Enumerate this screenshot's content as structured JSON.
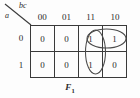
{
  "figure": {
    "type": "karnaugh-map",
    "caption_base": "F",
    "caption_sub": "1",
    "variable_row_label": "a",
    "variable_col_label": "bc",
    "column_headers": [
      "00",
      "01",
      "11",
      "10"
    ],
    "row_headers": [
      "0",
      "1"
    ],
    "cells": [
      [
        "0",
        "0",
        "1",
        "1"
      ],
      [
        "0",
        "0",
        "1",
        "0"
      ]
    ],
    "groups": [
      {
        "name": "horizontal-group-row0-cols-11-10",
        "shape": "ellipse",
        "orientation": "horizontal",
        "covers": [
          "row0-col11",
          "row0-col10"
        ]
      },
      {
        "name": "vertical-group-col11-rows-0-1",
        "shape": "ellipse",
        "orientation": "vertical",
        "covers": [
          "row0-col11",
          "row1-col11"
        ]
      }
    ],
    "colors": {
      "ink": "#2b2b2b",
      "grid_line": "#3a3a3a",
      "group_outline": "#4a4a4a",
      "background": "#fdfdfd"
    }
  }
}
